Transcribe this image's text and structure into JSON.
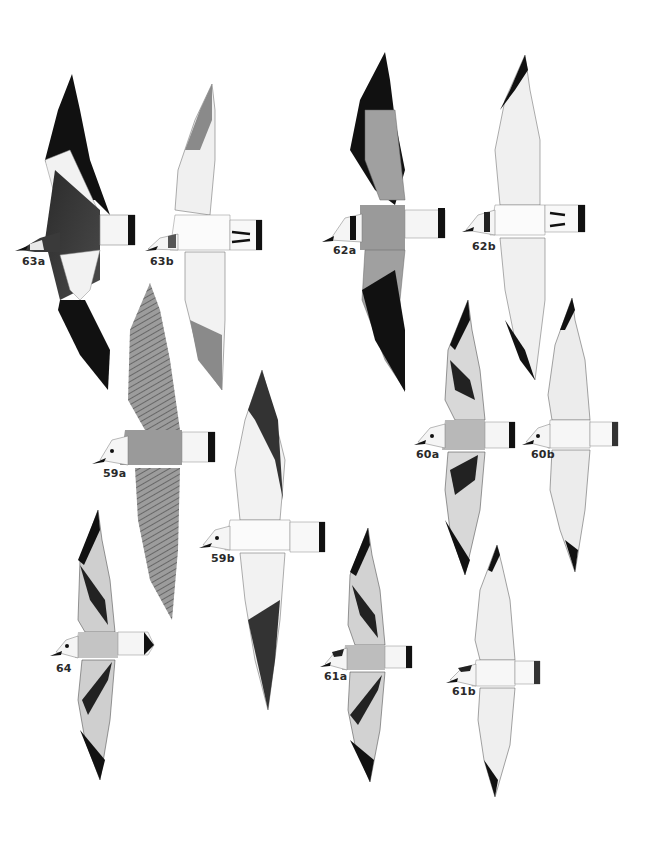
{
  "plate": {
    "background": "#ffffff",
    "figures": [
      {
        "id": "63a",
        "label": "63a",
        "x": 22,
        "y": 255
      },
      {
        "id": "63b",
        "label": "63b",
        "x": 150,
        "y": 255
      },
      {
        "id": "62a",
        "label": "62a",
        "x": 333,
        "y": 244
      },
      {
        "id": "62b",
        "label": "62b",
        "x": 472,
        "y": 240
      },
      {
        "id": "59a",
        "label": "59a",
        "x": 103,
        "y": 467
      },
      {
        "id": "59b",
        "label": "59b",
        "x": 211,
        "y": 552
      },
      {
        "id": "60a",
        "label": "60a",
        "x": 416,
        "y": 448
      },
      {
        "id": "60b",
        "label": "60b",
        "x": 531,
        "y": 448
      },
      {
        "id": "64",
        "label": "64",
        "x": 56,
        "y": 662
      },
      {
        "id": "61a",
        "label": "61a",
        "x": 324,
        "y": 670
      },
      {
        "id": "61b",
        "label": "61b",
        "x": 452,
        "y": 685
      }
    ]
  }
}
